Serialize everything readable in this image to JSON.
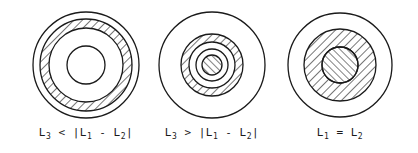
{
  "figures": [
    {
      "id": "fig1",
      "center": [
        86,
        65
      ],
      "label": {
        "parts": [
          "L",
          "3",
          " < |L",
          "1",
          " - L",
          "2",
          "|"
        ]
      },
      "label_text": "L3 < |L1 - L2|",
      "rings": [
        {
          "r": 53,
          "fill": "none"
        },
        {
          "r_outer": 46,
          "r_inner": 37,
          "fill": "hatch-backslash"
        },
        {
          "r": 19,
          "fill": "none"
        }
      ]
    },
    {
      "id": "fig2",
      "center": [
        212,
        65
      ],
      "label": {
        "parts": [
          "L",
          "3",
          " > |L",
          "1",
          " - L",
          "2",
          "|"
        ]
      },
      "label_text": "L3 > |L1 - L2|",
      "rings": [
        {
          "r": 53,
          "fill": "none"
        },
        {
          "r_outer": 31,
          "r_inner": 23,
          "fill": "hatch-backslash"
        },
        {
          "r": 16,
          "fill": "none"
        },
        {
          "r": 10,
          "fill": "hatch-slash"
        }
      ]
    },
    {
      "id": "fig3",
      "center": [
        340,
        65
      ],
      "label": {
        "parts": [
          "L",
          "1",
          " = L",
          "2",
          ""
        ]
      },
      "label_text": "L1 = L2",
      "rings": [
        {
          "r": 52,
          "fill": "none"
        },
        {
          "r_outer": 36,
          "r_inner": 18,
          "fill": "hatch-backslash"
        },
        {
          "r": 18,
          "fill": "hatch-slash"
        }
      ]
    }
  ],
  "colors": {
    "stroke": "#1a1a1a",
    "background": "#ffffff"
  }
}
